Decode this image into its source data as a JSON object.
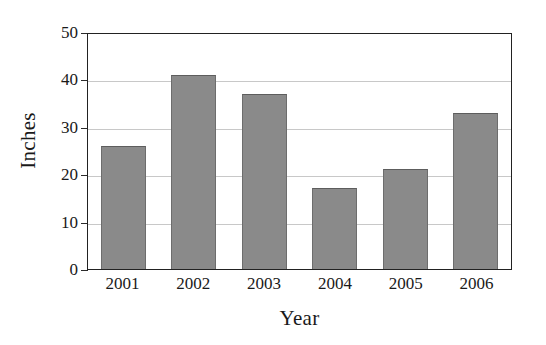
{
  "chart_data": {
    "type": "bar",
    "title": "",
    "subtitle": "",
    "categories": [
      "2001",
      "2002",
      "2003",
      "2004",
      "2005",
      "2006"
    ],
    "values": [
      26,
      41,
      37,
      17,
      21,
      33
    ],
    "series": [
      {
        "name": "Inches",
        "values": [
          26,
          41,
          37,
          17,
          21,
          33
        ]
      }
    ],
    "xlabel": "Year",
    "ylabel": "Inches",
    "ylim": [
      0,
      50
    ],
    "yticks": [
      0,
      10,
      20,
      30,
      40,
      50
    ],
    "ytick_labels": [
      "0",
      "10",
      "20",
      "30",
      "40",
      "50"
    ],
    "grid": true,
    "grid_axis": "y",
    "legend": false,
    "legend_position": "none",
    "annotations": [],
    "colors": {
      "bar_fill": "#8a8a8a",
      "bar_edge": "#5d5d5d",
      "gridline": "#c8c8c8",
      "frame": "#222222",
      "text": "#1a1a1a",
      "background": "#ffffff"
    }
  }
}
